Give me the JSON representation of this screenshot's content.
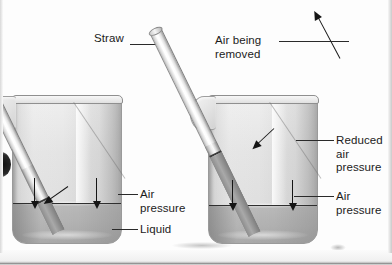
{
  "figure": {
    "kind": "science-diagram",
    "palette": {
      "background": "#fdfdfd",
      "ink": "#1b1b1b",
      "glass": "#e4e4e4",
      "liquid": "#b0b0b0",
      "arrow": "#151515"
    }
  },
  "panels": [
    {
      "id": "left-panel",
      "name": "straw-at-rest",
      "labels": {
        "straw": "Straw",
        "air_pressure": "Air\npressure",
        "liquid": "Liquid"
      },
      "arrows": {
        "down_left": "down-arrow-onto-liquid-left",
        "down_right": "down-arrow-onto-liquid-right",
        "straw_inward": "arrow-into-straw"
      }
    },
    {
      "id": "right-panel",
      "name": "straw-air-removed",
      "labels": {
        "air_being_removed": "Air  being\nremoved",
        "reduced_air_pressure": "Reduced\nair\npressure",
        "air_pressure": "Air\npressure"
      },
      "arrows": {
        "up_in_straw": "up-arrow-inside-straw",
        "down_left": "down-arrow-onto-liquid-left",
        "down_right": "down-arrow-onto-liquid-right",
        "reduced_pressure": "arrow-to-straw-meniscus"
      }
    }
  ]
}
